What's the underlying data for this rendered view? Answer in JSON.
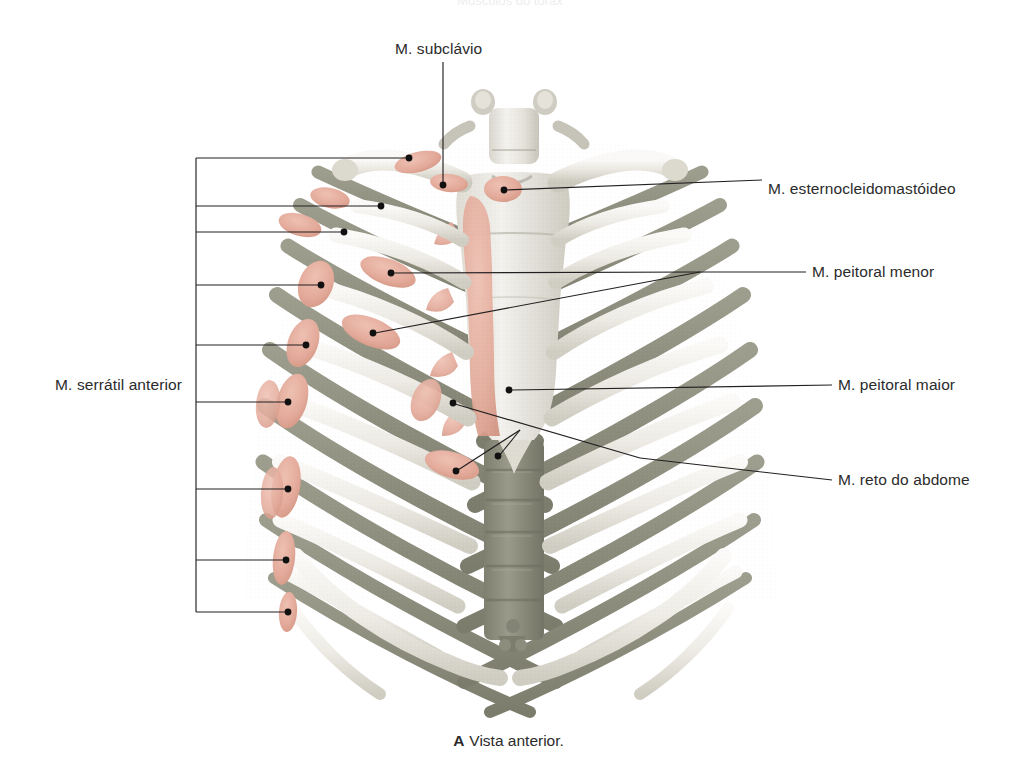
{
  "figure": {
    "title_cut_off": "Músculos do tórax",
    "caption_letter": "A",
    "caption_text": "Vista anterior.",
    "view": "anterior"
  },
  "colors": {
    "bone_light": "#ece9e3",
    "bone_highlight": "#f7f6f3",
    "bone_shadow": "#8d8d7d",
    "bone_mid": "#c9c7bd",
    "muscle_attachment_pink": "#e7b2a4",
    "muscle_attachment_pink_dark": "#d99e8f",
    "leader_line": "#231f20",
    "label_text": "#2b2b2b",
    "background": "#ffffff"
  },
  "labels": [
    {
      "id": "subclavius",
      "name": "M. subclávio",
      "side": "top",
      "text_x": 395,
      "text_y": 48,
      "anchor": "start"
    },
    {
      "id": "sternocleidomastoid",
      "name": "M. esternocleidomastóideo",
      "side": "right",
      "text_x": 768,
      "text_y": 180,
      "anchor": "start"
    },
    {
      "id": "pectoralis-minor",
      "name": "M. peitoral menor",
      "side": "right",
      "text_x": 812,
      "text_y": 270,
      "anchor": "start"
    },
    {
      "id": "pectoralis-major",
      "name": "M. peitoral maior",
      "side": "right",
      "text_x": 838,
      "text_y": 383,
      "anchor": "start"
    },
    {
      "id": "rectus-abdominis",
      "name": "M. reto do abdome",
      "side": "right",
      "text_x": 838,
      "text_y": 478,
      "anchor": "start"
    },
    {
      "id": "serratus-anterior",
      "name": "M. serrátil anterior",
      "side": "left",
      "text_x": 182,
      "text_y": 383,
      "anchor": "end"
    }
  ],
  "serratus_bracket": {
    "label": "M. serrátil anterior",
    "spine_x": 196,
    "top_y": 158,
    "bottom_y": 612,
    "leader_count": 8,
    "leaders": [
      {
        "y": 158,
        "end_x": 409,
        "end_y": 158
      },
      {
        "y": 206,
        "end_x": 381,
        "end_y": 206
      },
      {
        "y": 232,
        "end_x": 344,
        "end_y": 232
      },
      {
        "y": 285,
        "end_x": 321,
        "end_y": 285
      },
      {
        "y": 345,
        "end_x": 306,
        "end_y": 345
      },
      {
        "y": 402,
        "end_x": 288,
        "end_y": 402
      },
      {
        "y": 489,
        "end_x": 288,
        "end_y": 489
      },
      {
        "y": 560,
        "end_x": 286,
        "end_y": 560
      },
      {
        "y": 612,
        "end_x": 288,
        "end_y": 612
      }
    ]
  },
  "leader_targets": {
    "subclavius": {
      "x": 447,
      "y": 185
    },
    "sternocleidomastoid": {
      "x": 503,
      "y": 190
    },
    "pectoralis_minor": [
      {
        "x": 390,
        "y": 273
      },
      {
        "x": 372,
        "y": 333
      }
    ],
    "pectoralis_major": {
      "x": 508,
      "y": 390
    },
    "rectus_abdominis": [
      {
        "x": 452,
        "y": 402
      },
      {
        "x": 455,
        "y": 468
      },
      {
        "x": 497,
        "y": 455
      }
    ]
  },
  "anatomy_parts": [
    {
      "name": "T1 vertebra",
      "visible": true
    },
    {
      "name": "clavicle-left",
      "visible": true
    },
    {
      "name": "clavicle-right",
      "visible": true
    },
    {
      "name": "sternum-manubrium",
      "visible": true
    },
    {
      "name": "sternum-body",
      "visible": true
    },
    {
      "name": "xiphoid-process",
      "visible": true
    },
    {
      "name": "ribs",
      "count": 12,
      "visible": true
    },
    {
      "name": "costal-arch",
      "visible": true
    },
    {
      "name": "thoracic-spine",
      "visible": true
    }
  ]
}
